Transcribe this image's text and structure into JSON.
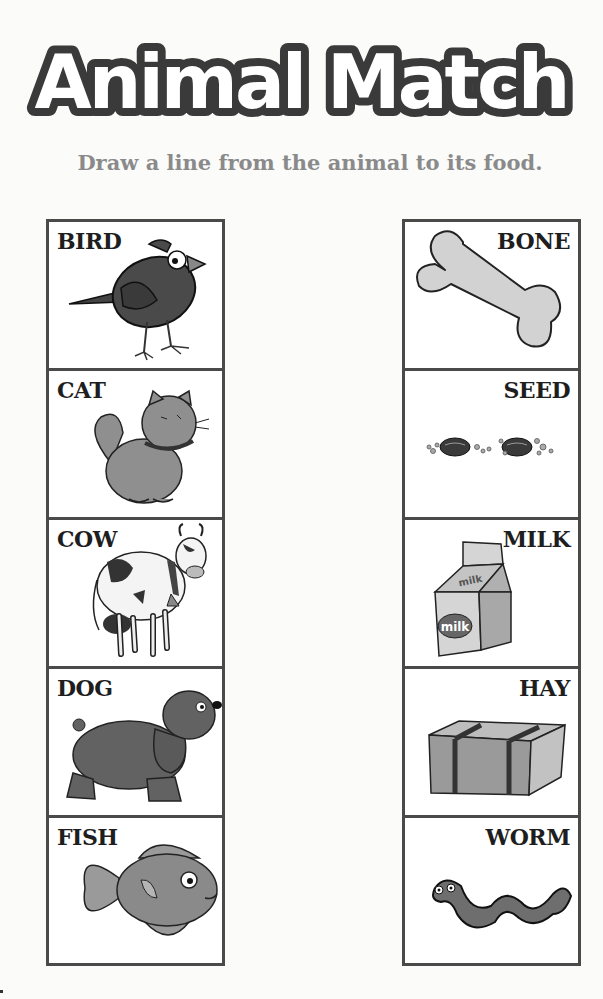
{
  "title": "Animal Match",
  "subtitle": "Draw a line from the animal to its food.",
  "colors": {
    "border": "#4a4a4a",
    "title_outline": "#3a3a3a",
    "subtitle": "#8a8a8a",
    "illustration_fill": "#8f8f8f",
    "illustration_light": "#d2d2d2"
  },
  "animals": [
    {
      "label": "BIRD",
      "icon": "bird-icon"
    },
    {
      "label": "CAT",
      "icon": "cat-icon"
    },
    {
      "label": "COW",
      "icon": "cow-icon"
    },
    {
      "label": "DOG",
      "icon": "dog-icon"
    },
    {
      "label": "FISH",
      "icon": "fish-icon"
    }
  ],
  "foods": [
    {
      "label": "BONE",
      "icon": "bone-icon"
    },
    {
      "label": "SEED",
      "icon": "seed-icon"
    },
    {
      "label": "MILK",
      "icon": "milk-carton-icon",
      "carton_text": "milk"
    },
    {
      "label": "HAY",
      "icon": "hay-bale-icon"
    },
    {
      "label": "WORM",
      "icon": "worm-icon"
    }
  ]
}
